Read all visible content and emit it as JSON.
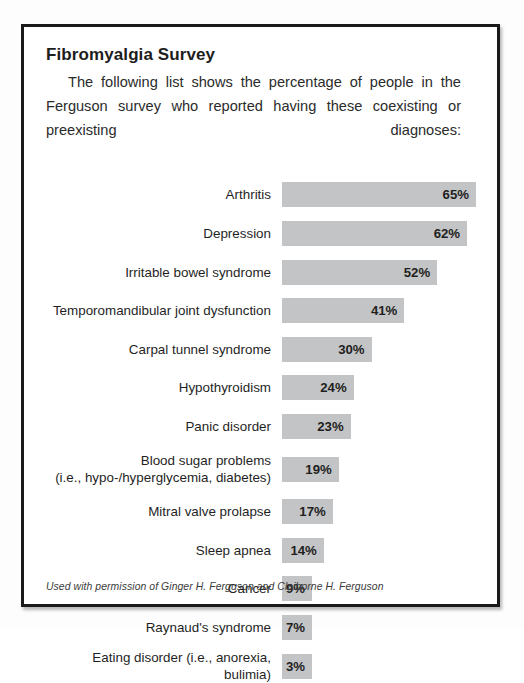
{
  "figure": {
    "title": "Fibromyalgia Survey",
    "intro": "The following list shows the percentage of people in the Ferguson survey who reported having these coexisting or preexisting diagnoses:",
    "credit": "Used with permission of Ginger H. Ferguson and Claiborne H. Ferguson",
    "bar_color": "#c3c4c5",
    "frame_color": "#1a1a1a",
    "background": "#ffffff"
  },
  "chart_data": {
    "type": "bar",
    "orientation": "horizontal",
    "title": "Fibromyalgia Survey",
    "xlabel": "",
    "ylabel": "",
    "xlim": [
      0,
      65
    ],
    "grid": false,
    "legend": null,
    "value_suffix": "%",
    "categories": [
      "Arthritis",
      "Depression",
      "Irritable bowel syndrome",
      "Temporomandibular joint dysfunction",
      "Carpal tunnel syndrome",
      "Hypothyroidism",
      "Panic disorder",
      "Blood sugar problems\n(i.e., hypo-/hyperglycemia, diabetes)",
      "Mitral valve prolapse",
      "Sleep apnea",
      "Cancer",
      "Raynaud's syndrome",
      "Eating disorder (i.e., anorexia, bulimia)"
    ],
    "values": [
      65,
      62,
      52,
      41,
      30,
      24,
      23,
      19,
      17,
      14,
      9,
      7,
      3
    ],
    "labels": [
      "65%",
      "62%",
      "52%",
      "41%",
      "30%",
      "24%",
      "23%",
      "19%",
      "17%",
      "14%",
      "9%",
      "7%",
      "3%"
    ],
    "rows": [
      {
        "label": "Arthritis",
        "value": 65,
        "display": "65%",
        "two_line": false
      },
      {
        "label": "Depression",
        "value": 62,
        "display": "62%",
        "two_line": false
      },
      {
        "label": "Irritable bowel syndrome",
        "value": 52,
        "display": "52%",
        "two_line": false
      },
      {
        "label": "Temporomandibular joint dysfunction",
        "value": 41,
        "display": "41%",
        "two_line": false
      },
      {
        "label": "Carpal tunnel syndrome",
        "value": 30,
        "display": "30%",
        "two_line": false
      },
      {
        "label": "Hypothyroidism",
        "value": 24,
        "display": "24%",
        "two_line": false
      },
      {
        "label": "Panic disorder",
        "value": 23,
        "display": "23%",
        "two_line": false
      },
      {
        "label": "Blood sugar problems\n(i.e., hypo-/hyperglycemia, diabetes)",
        "value": 19,
        "display": "19%",
        "two_line": true
      },
      {
        "label": "Mitral valve prolapse",
        "value": 17,
        "display": "17%",
        "two_line": false
      },
      {
        "label": "Sleep apnea",
        "value": 14,
        "display": "14%",
        "two_line": false
      },
      {
        "label": "Cancer",
        "value": 9,
        "display": "9%",
        "two_line": false
      },
      {
        "label": "Raynaud's syndrome",
        "value": 7,
        "display": "7%",
        "two_line": false
      },
      {
        "label": "Eating disorder (i.e., anorexia, bulimia)",
        "value": 3,
        "display": "3%",
        "two_line": false
      }
    ]
  }
}
